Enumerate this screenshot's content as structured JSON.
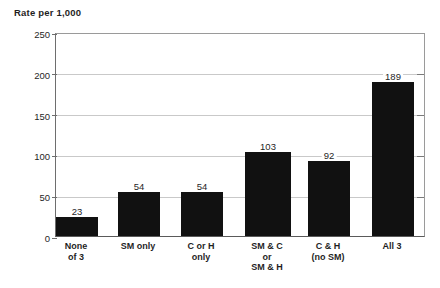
{
  "chart_data": {
    "type": "bar",
    "title": "Rate per 1,000",
    "xlabel": "",
    "ylabel": "Rate per 1,000",
    "categories": [
      "None\nof 3",
      "SM only",
      "C or H\nonly",
      "SM & C\nor\nSM & H",
      "C & H\n(no SM)",
      "All 3"
    ],
    "values": [
      23,
      54,
      54,
      103,
      92,
      189
    ],
    "value_labels": [
      "23",
      "54",
      "54",
      "103",
      "92",
      "189"
    ],
    "ylim": [
      0,
      250
    ],
    "yticks": [
      0,
      50,
      100,
      150,
      200,
      250
    ],
    "ytick_labels": [
      "0",
      "50",
      "100",
      "150",
      "200",
      "250"
    ],
    "grid": true,
    "legend": null,
    "bar_color": "#111111",
    "gridline_color": "#c9c9c9",
    "axis_color": "#5a5a5a"
  }
}
